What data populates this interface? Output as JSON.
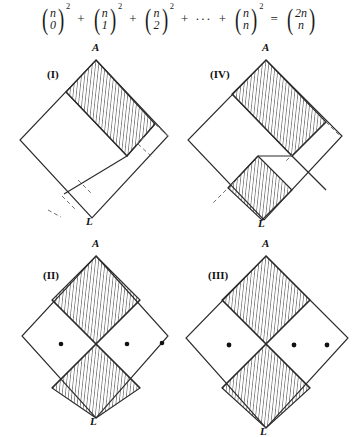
{
  "figure": {
    "title_formula": {
      "terms": [
        {
          "kind": "binom",
          "top": "n",
          "bottom": "0",
          "exponent": "2"
        },
        {
          "kind": "op",
          "text": "+"
        },
        {
          "kind": "binom",
          "top": "n",
          "bottom": "1",
          "exponent": "2"
        },
        {
          "kind": "op",
          "text": "+"
        },
        {
          "kind": "binom",
          "top": "n",
          "bottom": "2",
          "exponent": "2"
        },
        {
          "kind": "op",
          "text": "+"
        },
        {
          "kind": "dots",
          "text": "···"
        },
        {
          "kind": "op",
          "text": "+"
        },
        {
          "kind": "binom",
          "top": "n",
          "bottom": "n",
          "exponent": "2"
        },
        {
          "kind": "op",
          "text": "="
        },
        {
          "kind": "binom",
          "top": "2n",
          "bottom": "n",
          "exponent": ""
        }
      ],
      "plain_text": "(n 0)^2 + (n 1)^2 + (n 2)^2 + ... + (n n)^2 = (2n n)"
    },
    "colors": {
      "ink": "#1a1a1a",
      "stroke": "#2b2b2b",
      "hatch": "#3a3a3a",
      "dash": "#6e6e6e",
      "background": "#ffffff",
      "dot": "#111111"
    },
    "panels": [
      {
        "id": "panel-1",
        "roman_label": "(I)",
        "top_vertex_label": "A",
        "bottom_vertex_label": "L",
        "hatched_regions": 1,
        "dot_count": 0,
        "has_dashed_subdivisions": true,
        "position": {
          "x": 16,
          "y": 52,
          "w": 160,
          "h": 180
        }
      },
      {
        "id": "panel-4",
        "roman_label": "(IV)",
        "top_vertex_label": "A",
        "bottom_vertex_label": "L",
        "hatched_regions": 2,
        "dot_count": 0,
        "has_dashed_subdivisions": true,
        "position": {
          "x": 186,
          "y": 52,
          "w": 164,
          "h": 180
        }
      },
      {
        "id": "panel-2",
        "roman_label": "(II)",
        "top_vertex_label": "A",
        "bottom_vertex_label": "L",
        "hatched_regions": 2,
        "dot_count": 3,
        "has_dashed_subdivisions": false,
        "position": {
          "x": 16,
          "y": 248,
          "w": 160,
          "h": 186
        }
      },
      {
        "id": "panel-3",
        "roman_label": "(III)",
        "top_vertex_label": "A",
        "bottom_vertex_label": "L",
        "hatched_regions": 2,
        "dot_count": 3,
        "has_dashed_subdivisions": false,
        "position": {
          "x": 186,
          "y": 248,
          "w": 164,
          "h": 186
        }
      }
    ]
  }
}
